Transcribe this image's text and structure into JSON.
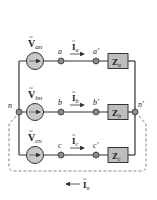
{
  "diagram": {
    "colors": {
      "wire": "#333333",
      "source_fill": "#c8c8c8",
      "impedance_fill": "#bdbdbd",
      "node_fill": "#8a8a8a",
      "dashed": "#777777"
    },
    "sources": [
      {
        "id": "Van",
        "label_main": "V",
        "label_sub": "an"
      },
      {
        "id": "Vbn",
        "label_main": "V",
        "label_sub": "bn"
      },
      {
        "id": "Vcn",
        "label_main": "V",
        "label_sub": "cn"
      }
    ],
    "nodes": {
      "a": "a",
      "a_prime": "a'",
      "b": "b",
      "b_prime": "b'",
      "c": "c",
      "c_prime": "c'",
      "n": "n",
      "n_prime": "n'"
    },
    "currents": [
      {
        "id": "Ia",
        "label_main": "I",
        "label_sub": "a"
      },
      {
        "id": "Ib",
        "label_main": "I",
        "label_sub": "b"
      },
      {
        "id": "Ic",
        "label_main": "I",
        "label_sub": "c"
      },
      {
        "id": "In",
        "label_main": "I",
        "label_sub": "n"
      }
    ],
    "impedances": [
      {
        "id": "Za",
        "label_main": "Z",
        "label_sub": "a"
      },
      {
        "id": "Zb",
        "label_main": "Z",
        "label_sub": "b"
      },
      {
        "id": "Zc",
        "label_main": "Z",
        "label_sub": "c"
      }
    ],
    "tilde": "~"
  }
}
